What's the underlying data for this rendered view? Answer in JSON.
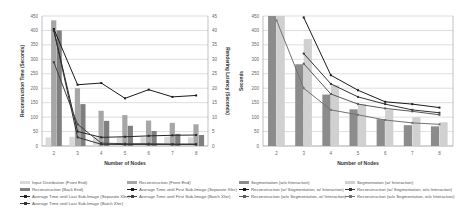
{
  "chart_data": [
    {
      "type": "bar+line",
      "title": "",
      "xlabel": "Number of Nodes",
      "ylabel": "Reconstruction Time (Seconds)",
      "y2label": "Rendering Latency (Seconds)",
      "categories": [
        "2",
        "3",
        "4",
        "5",
        "6",
        "7",
        "8"
      ],
      "ylim": [
        0,
        450
      ],
      "y2lim": [
        0,
        45
      ],
      "yticks": [
        0,
        50,
        100,
        150,
        200,
        250,
        300,
        350,
        400,
        450
      ],
      "y2ticks": [
        0,
        5,
        10,
        15,
        20,
        25,
        30,
        35,
        40,
        45
      ],
      "grid": true,
      "legend_position": "bottom",
      "series": [
        {
          "name": "Input Distribution (Front End)",
          "kind": "bar",
          "axis": "left",
          "color": "#d9d9d9",
          "values": [
            30,
            32,
            30,
            30,
            30,
            32,
            30
          ]
        },
        {
          "name": "Reconstruction (Front End)",
          "kind": "bar",
          "axis": "left",
          "color": "#a6a6a6",
          "values": [
            435,
            200,
            122,
            107,
            88,
            80,
            75
          ]
        },
        {
          "name": "Reconstruction (Back End)",
          "kind": "bar",
          "axis": "left",
          "color": "#7f7f7f",
          "values": [
            400,
            145,
            87,
            70,
            52,
            42,
            38
          ]
        },
        {
          "name": "Average Time until First Sub-Image (Separate Xfer)",
          "kind": "line",
          "axis": "right",
          "color": "#1a1a1a",
          "values": [
            40.5,
            21.2,
            21.8,
            16.5,
            19.5,
            17,
            17.5
          ]
        },
        {
          "name": "Average Time until Last Sub-Image (Separate Xfer)",
          "kind": "line",
          "axis": "right",
          "color": "#262626",
          "values": [
            40,
            5,
            3,
            3.2,
            3.5,
            3.7,
            3.8
          ]
        },
        {
          "name": "Average Time until First Sub-Image (Batch Xfer)",
          "kind": "line",
          "axis": "right",
          "color": "#404040",
          "values": [
            29,
            7.5,
            1,
            0.8,
            0.8,
            0.7,
            0.7
          ]
        },
        {
          "name": "Average Time until Last Sub-Image (Batch Xfer)",
          "kind": "line",
          "axis": "right",
          "color": "#333333",
          "values": [
            40,
            3,
            0.6,
            0.5,
            0.5,
            0.5,
            0.5
          ]
        }
      ]
    },
    {
      "type": "bar+line",
      "title": "",
      "xlabel": "Number of Nodes",
      "ylabel": "Seconds",
      "categories": [
        "2",
        "3",
        "4",
        "5",
        "6",
        "7",
        "8"
      ],
      "ylim": [
        0,
        450
      ],
      "yticks": [
        0,
        50,
        100,
        150,
        200,
        250,
        300,
        350,
        400,
        450
      ],
      "grid": true,
      "legend_position": "bottom",
      "series": [
        {
          "name": "Segmentation (w/o Interaction)",
          "kind": "bar",
          "color": "#8c8c8c",
          "values": [
            450,
            283,
            178,
            127,
            93,
            72,
            68
          ]
        },
        {
          "name": "Segmentation (w/ Interaction)",
          "kind": "bar",
          "color": "#d0d0d0",
          "values": [
            450,
            370,
            210,
            145,
            125,
            100,
            82
          ]
        },
        {
          "name": "Reconstruction (w/ Segmentation, w/ Interaction)",
          "kind": "line",
          "color": "#1a1a1a",
          "values": [
            null,
            445,
            245,
            193,
            153,
            145,
            133
          ]
        },
        {
          "name": "Reconstruction (w/ Segmentation, w/o Interaction)",
          "kind": "line",
          "color": "#333333",
          "values": [
            null,
            320,
            215,
            170,
            145,
            125,
            115
          ]
        },
        {
          "name": "Reconstruction (w/o Segmentation, w/ Interaction)",
          "kind": "line",
          "color": "#595959",
          "values": [
            null,
            285,
            180,
            145,
            130,
            120,
            108
          ]
        },
        {
          "name": "Reconstruction (w/o Segmentation, w/o Interaction)",
          "kind": "line",
          "color": "#737373",
          "values": [
            435,
            200,
            125,
            108,
            90,
            80,
            75
          ]
        }
      ]
    }
  ]
}
